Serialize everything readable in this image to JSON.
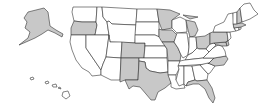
{
  "map": {
    "title": "United States",
    "colors": {
      "highlighted": "#c8c8c8",
      "default": "#ffffff",
      "border": "#333333"
    },
    "states": [
      {
        "id": "AK",
        "name": "Alaska",
        "highlighted": true
      },
      {
        "id": "HI",
        "name": "Hawaii",
        "highlighted": false
      },
      {
        "id": "WA",
        "name": "Washington",
        "highlighted": false
      },
      {
        "id": "OR",
        "name": "Oregon",
        "highlighted": true
      },
      {
        "id": "CA",
        "name": "California",
        "highlighted": false
      },
      {
        "id": "ID",
        "name": "Idaho",
        "highlighted": false
      },
      {
        "id": "NV",
        "name": "Nevada",
        "highlighted": false
      },
      {
        "id": "MT",
        "name": "Montana",
        "highlighted": false
      },
      {
        "id": "WY",
        "name": "Wyoming",
        "highlighted": false
      },
      {
        "id": "UT",
        "name": "Utah",
        "highlighted": false
      },
      {
        "id": "AZ",
        "name": "Arizona",
        "highlighted": false
      },
      {
        "id": "CO",
        "name": "Colorado",
        "highlighted": true
      },
      {
        "id": "NM",
        "name": "New Mexico",
        "highlighted": true
      },
      {
        "id": "ND",
        "name": "North Dakota",
        "highlighted": false
      },
      {
        "id": "SD",
        "name": "South Dakota",
        "highlighted": false
      },
      {
        "id": "NE",
        "name": "Nebraska",
        "highlighted": false
      },
      {
        "id": "KS",
        "name": "Kansas",
        "highlighted": false
      },
      {
        "id": "OK",
        "name": "Oklahoma",
        "highlighted": false
      },
      {
        "id": "TX",
        "name": "Texas",
        "highlighted": true
      },
      {
        "id": "MN",
        "name": "Minnesota",
        "highlighted": true
      },
      {
        "id": "IA",
        "name": "Iowa",
        "highlighted": true
      },
      {
        "id": "MO",
        "name": "Missouri",
        "highlighted": true
      },
      {
        "id": "AR",
        "name": "Arkansas",
        "highlighted": false
      },
      {
        "id": "LA",
        "name": "Louisiana",
        "highlighted": false
      },
      {
        "id": "WI",
        "name": "Wisconsin",
        "highlighted": false
      },
      {
        "id": "IL",
        "name": "Illinois",
        "highlighted": false
      },
      {
        "id": "MI",
        "name": "Michigan",
        "highlighted": true
      },
      {
        "id": "IN",
        "name": "Indiana",
        "highlighted": false
      },
      {
        "id": "OH",
        "name": "Ohio",
        "highlighted": true
      },
      {
        "id": "KY",
        "name": "Kentucky",
        "highlighted": false
      },
      {
        "id": "TN",
        "name": "Tennessee",
        "highlighted": false
      },
      {
        "id": "MS",
        "name": "Mississippi",
        "highlighted": false
      },
      {
        "id": "AL",
        "name": "Alabama",
        "highlighted": false
      },
      {
        "id": "GA",
        "name": "Georgia",
        "highlighted": false
      },
      {
        "id": "FL",
        "name": "Florida",
        "highlighted": true
      },
      {
        "id": "SC",
        "name": "South Carolina",
        "highlighted": false
      },
      {
        "id": "NC",
        "name": "North Carolina",
        "highlighted": true
      },
      {
        "id": "VA",
        "name": "Virginia",
        "highlighted": false
      },
      {
        "id": "WV",
        "name": "West Virginia",
        "highlighted": false
      },
      {
        "id": "MD",
        "name": "Maryland",
        "highlighted": true
      },
      {
        "id": "DE",
        "name": "Delaware",
        "highlighted": true
      },
      {
        "id": "PA",
        "name": "Pennsylvania",
        "highlighted": true
      },
      {
        "id": "NJ",
        "name": "New Jersey",
        "highlighted": false
      },
      {
        "id": "NY",
        "name": "New York",
        "highlighted": false
      },
      {
        "id": "CT",
        "name": "Connecticut",
        "highlighted": false
      },
      {
        "id": "RI",
        "name": "Rhode Island",
        "highlighted": false
      },
      {
        "id": "MA",
        "name": "Massachusetts",
        "highlighted": true
      },
      {
        "id": "VT",
        "name": "Vermont",
        "highlighted": false
      },
      {
        "id": "NH",
        "name": "New Hampshire",
        "highlighted": true
      },
      {
        "id": "ME",
        "name": "Maine",
        "highlighted": false
      }
    ]
  }
}
